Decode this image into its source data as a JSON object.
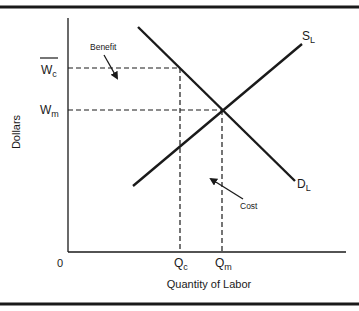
{
  "diagram": {
    "type": "supply-demand-labor-market",
    "axes": {
      "y_label": "Dollars",
      "x_label": "Quantity of Labor",
      "origin_label": "0"
    },
    "price_levels": [
      {
        "main": "W",
        "sub": "c",
        "overline": true,
        "name": "wc-label"
      },
      {
        "main": "W",
        "sub": "m",
        "overline": false,
        "name": "wm-label"
      }
    ],
    "quantity_levels": [
      {
        "main": "Q",
        "sub": "c",
        "name": "qc-label"
      },
      {
        "main": "Q",
        "sub": "m",
        "name": "qm-label"
      }
    ],
    "curves": {
      "supply": {
        "main": "S",
        "sub": "L"
      },
      "demand": {
        "main": "D",
        "sub": "L"
      }
    },
    "annotations": {
      "benefit": "Benefit",
      "cost": "Cost"
    },
    "colors": {
      "ink": "#1a1a1a",
      "background": "#ffffff"
    }
  }
}
